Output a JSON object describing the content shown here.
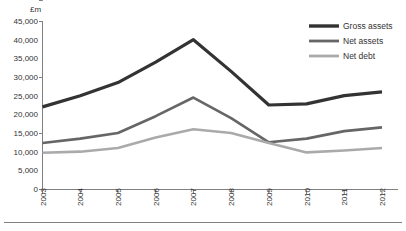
{
  "chart_data": {
    "type": "line",
    "title": "",
    "subtitle": "",
    "xlabel": "",
    "ylabel": "£m",
    "ylim": [
      0,
      45000
    ],
    "ytick_labels": [
      "45,000",
      "40,000",
      "35,000",
      "30,000",
      "25,000",
      "20,000",
      "15,000",
      "10,000",
      "5,000",
      "0"
    ],
    "ytick_values": [
      45000,
      40000,
      35000,
      30000,
      25000,
      20000,
      15000,
      10000,
      5000,
      0
    ],
    "grid": false,
    "legend_position": "top-right",
    "categories": [
      "2003",
      "2004",
      "2005",
      "2006",
      "2007",
      "2008",
      "2009",
      "2010",
      "2011",
      "2012"
    ],
    "series": [
      {
        "name": "Gross assets",
        "color": "#333333",
        "values": [
          22000,
          25000,
          28500,
          34000,
          40000,
          31500,
          22500,
          22800,
          25000,
          26000
        ]
      },
      {
        "name": "Net assets",
        "color": "#666666",
        "values": [
          12300,
          13500,
          15000,
          19500,
          24500,
          19000,
          12500,
          13500,
          15500,
          16500
        ]
      },
      {
        "name": "Net debt",
        "color": "#aaaaaa",
        "values": [
          9700,
          10000,
          11000,
          13800,
          16000,
          15000,
          12300,
          9800,
          10300,
          11000
        ]
      }
    ]
  },
  "legend": {
    "items": [
      {
        "label": "Gross assets",
        "color": "#333333"
      },
      {
        "label": "Net assets",
        "color": "#666666"
      },
      {
        "label": "Net debt",
        "color": "#aaaaaa"
      }
    ]
  },
  "axes": {
    "y_axis_title": "£m"
  }
}
